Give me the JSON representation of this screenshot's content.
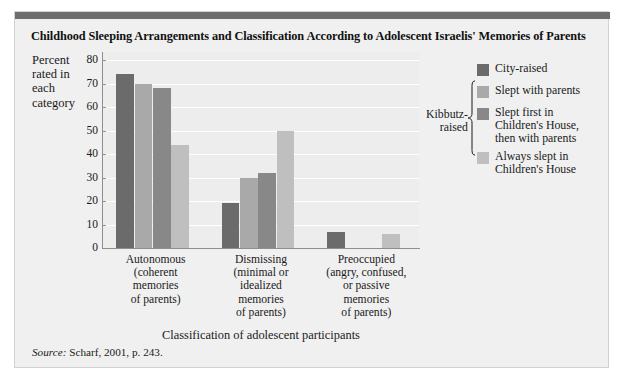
{
  "figure": {
    "title": "Childhood Sleeping Arrangements and Classification According to Adolescent Israelis' Memories of Parents",
    "source_prefix": "Source:",
    "source_text": "Scharf, 2001, p. 243.",
    "brace_label": "Kibbutz-\nraised",
    "colors": {
      "panel_background": "#f0f0f0",
      "plot_background": "#ededed",
      "gridline": "#ffffff",
      "axis": "#8e8e8e",
      "top_rule": "#6e6e6e",
      "text": "#1a1a1a"
    }
  },
  "chart_data": {
    "type": "bar",
    "title": "Childhood Sleeping Arrangements and Classification According to Adolescent Israelis' Memories of Parents",
    "xlabel": "Classification of adolescent participants",
    "ylabel": "Percent rated in each category",
    "ylim": [
      0,
      80
    ],
    "yticks": [
      0,
      10,
      20,
      30,
      40,
      50,
      60,
      70,
      80
    ],
    "grid": true,
    "legend_position": "right",
    "categories": [
      "Autonomous\n(coherent\nmemories\nof parents)",
      "Dismissing\n(minimal or\nidealized\nmemories\nof parents)",
      "Preoccupied\n(angry, confused,\nor passive\nmemories\nof parents)"
    ],
    "category_lines": [
      [
        "Autonomous",
        "(coherent",
        "memories",
        "of parents)"
      ],
      [
        "Dismissing",
        "(minimal or",
        "idealized",
        "memories",
        "of parents)"
      ],
      [
        "Preoccupied",
        "(angry, confused,",
        "or passive",
        "memories",
        "of parents)"
      ]
    ],
    "series": [
      {
        "name": "City-raised",
        "color": "#6b6b6b",
        "values": [
          74,
          19,
          7
        ]
      },
      {
        "name": "Slept with parents",
        "color": "#a9a9a9",
        "values": [
          70,
          30,
          0
        ]
      },
      {
        "name": "Slept first in Children's House, then with parents",
        "color": "#888888",
        "values": [
          68,
          32,
          0
        ]
      },
      {
        "name": "Always slept in Children's House",
        "color": "#bfbfbf",
        "values": [
          44,
          50,
          6
        ]
      }
    ]
  },
  "legend": {
    "items": [
      {
        "label": "City-raised",
        "lines": [
          "City-raised"
        ],
        "color": "#6b6b6b"
      },
      {
        "label": "Slept with parents",
        "lines": [
          "Slept with parents"
        ],
        "color": "#a9a9a9"
      },
      {
        "label": "Slept first in Children's House, then with parents",
        "lines": [
          "Slept first in",
          "Children's House,",
          "then with parents"
        ],
        "color": "#888888"
      },
      {
        "label": "Always slept in Children's House",
        "lines": [
          "Always slept in",
          "Children's House"
        ],
        "color": "#bfbfbf"
      }
    ],
    "brace_lines": [
      "Kibbutz-",
      "raised"
    ]
  }
}
